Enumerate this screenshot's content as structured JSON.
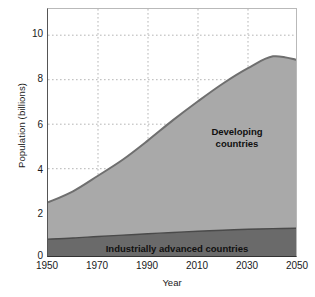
{
  "chart_data": {
    "type": "area",
    "stacked": true,
    "title": "",
    "xlabel": "Year",
    "ylabel": "Population (billions)",
    "xlim": [
      1950,
      2050
    ],
    "ylim": [
      0,
      11.2
    ],
    "xticks": [
      1950,
      1970,
      1990,
      2010,
      2030,
      2050
    ],
    "yticks": [
      0,
      2,
      4,
      6,
      8,
      10
    ],
    "grid": true,
    "grid_style": "dotted",
    "legend_position": "inline-annotations",
    "x": [
      1950,
      1960,
      1970,
      1980,
      1990,
      2000,
      2010,
      2020,
      2030,
      2040,
      2050
    ],
    "series": [
      {
        "name": "Industrially advanced countries",
        "color": "#6a6a6a",
        "values": [
          0.85,
          0.9,
          0.97,
          1.03,
          1.09,
          1.15,
          1.2,
          1.25,
          1.29,
          1.32,
          1.34
        ]
      },
      {
        "name": "Developing countries",
        "color": "#a9a9a9",
        "values": [
          1.65,
          2.1,
          2.73,
          3.4,
          4.2,
          5.05,
          5.85,
          6.6,
          7.25,
          7.75,
          7.56
        ]
      }
    ],
    "totals": [
      2.5,
      3.0,
      3.7,
      4.43,
      5.29,
      6.2,
      7.05,
      7.85,
      8.54,
      9.07,
      8.9
    ],
    "annotations": [
      {
        "text": "Developing countries",
        "x": 2025,
        "y": 5.6
      },
      {
        "text": "Industrially advanced countries",
        "x": 2000,
        "y": 0.55
      }
    ]
  },
  "axes": {
    "y_title": "Population (billions)",
    "x_title": "Year",
    "y_tick_labels": [
      "10",
      "8",
      "6",
      "4",
      "2",
      "0"
    ],
    "x_tick_labels": [
      "1950",
      "1970",
      "1990",
      "2010",
      "2030",
      "2050"
    ]
  },
  "labels": {
    "developing": "Developing\ncountries",
    "industrially_advanced": "Industrially advanced countries"
  },
  "colors": {
    "developing_fill": "#a9a9a9",
    "developing_edge": "#6f6f6f",
    "iac_fill": "#6a6a6a",
    "iac_edge": "#4a4a4a",
    "grid": "#b5b5b5",
    "axis": "#3a3a3a",
    "background": "#ffffff"
  }
}
